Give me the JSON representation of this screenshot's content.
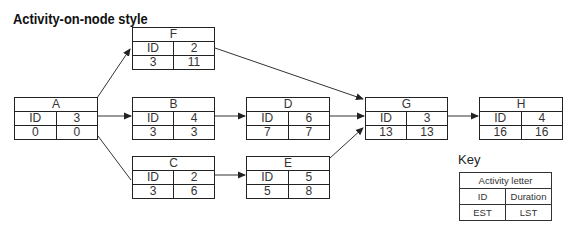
{
  "title": "Activity-on-node style",
  "nodes": {
    "F": {
      "letter": "F",
      "id_label": "ID",
      "duration": "2",
      "est": "3",
      "lst": "11"
    },
    "A": {
      "letter": "A",
      "id_label": "ID",
      "duration": "3",
      "est": "0",
      "lst": "0"
    },
    "B": {
      "letter": "B",
      "id_label": "ID",
      "duration": "4",
      "est": "3",
      "lst": "3"
    },
    "C": {
      "letter": "C",
      "id_label": "ID",
      "duration": "2",
      "est": "3",
      "lst": "6"
    },
    "D": {
      "letter": "D",
      "id_label": "ID",
      "duration": "6",
      "est": "7",
      "lst": "7"
    },
    "E": {
      "letter": "E",
      "id_label": "ID",
      "duration": "5",
      "est": "5",
      "lst": "8"
    },
    "G": {
      "letter": "G",
      "id_label": "ID",
      "duration": "3",
      "est": "13",
      "lst": "13"
    },
    "H": {
      "letter": "H",
      "id_label": "ID",
      "duration": "4",
      "est": "16",
      "lst": "16"
    }
  },
  "edges": [
    {
      "from": "A",
      "to": "F"
    },
    {
      "from": "A",
      "to": "B"
    },
    {
      "from": "A",
      "to": "C"
    },
    {
      "from": "B",
      "to": "D"
    },
    {
      "from": "C",
      "to": "E"
    },
    {
      "from": "D",
      "to": "G"
    },
    {
      "from": "F",
      "to": "G"
    },
    {
      "from": "E",
      "to": "G"
    },
    {
      "from": "G",
      "to": "H"
    }
  ],
  "key": {
    "label": "Key",
    "header": "Activity letter",
    "row1": [
      "ID",
      "Duration"
    ],
    "row2": [
      "EST",
      "LST"
    ]
  },
  "colors": {
    "line": "#222222",
    "text": "#333333",
    "background": "#ffffff"
  }
}
